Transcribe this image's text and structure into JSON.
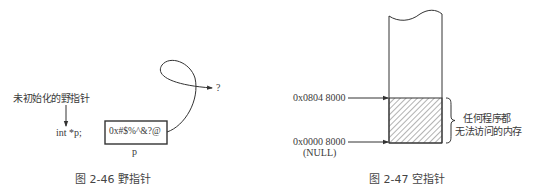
{
  "figure_left": {
    "annotation": "未初始化的野指针",
    "declaration": "int *p;",
    "box_value": "0x#$%^&?@",
    "box_label": "p",
    "target_label": "?",
    "caption": "图 2-46   野指针"
  },
  "figure_right": {
    "address_top": "0x0804 8000",
    "address_bottom": "0x0000 8000",
    "null_label": "(NULL)",
    "region_note_line1": "任何程序都",
    "region_note_line2": "无法访问的内存",
    "caption": "图 2-47   空指针"
  },
  "colors": {
    "line": "#333333",
    "text": "#3a3a3a",
    "background": "#ffffff"
  }
}
